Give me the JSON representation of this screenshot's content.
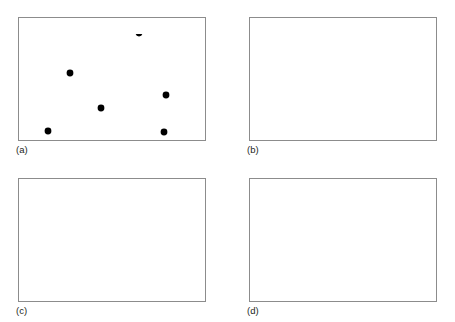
{
  "figure": {
    "width": 455,
    "height": 322,
    "background": "#ffffff"
  },
  "style": {
    "frame_color": "#8c8c8c",
    "frame_width": 1,
    "point_color": "#000000",
    "point_radius": 3.4,
    "solid_line_color": "#58585b",
    "solid_line_width": 1,
    "dotted_line_color": "#000000",
    "dotted_line_width": 3.4,
    "dotted_dash": "0.2 5.4",
    "label_color": "#231f20",
    "label_font_size": 9.5
  },
  "panels": [
    {
      "id": "a",
      "label": "(a)",
      "label_x": 16,
      "label_y": 153,
      "frame": {
        "x": 18,
        "y": 17,
        "width": 187,
        "height": 123
      },
      "shows_points": true,
      "shows_triangulation": false,
      "shows_voronoi": false
    },
    {
      "id": "b",
      "label": "(b)",
      "label_x": 247,
      "label_y": 153,
      "frame": {
        "x": 249,
        "y": 17,
        "width": 187,
        "height": 123
      },
      "shows_points": true,
      "shows_triangulation": true,
      "shows_voronoi": false
    },
    {
      "id": "c",
      "label": "(c)",
      "label_x": 16,
      "label_y": 314,
      "frame": {
        "x": 18,
        "y": 178,
        "width": 187,
        "height": 123
      },
      "shows_points": true,
      "shows_triangulation": true,
      "shows_voronoi": true
    },
    {
      "id": "d",
      "label": "(d)",
      "label_x": 247,
      "label_y": 314,
      "frame": {
        "x": 249,
        "y": 178,
        "width": 187,
        "height": 123
      },
      "shows_points": true,
      "shows_triangulation": false,
      "shows_voronoi": true
    }
  ],
  "geometry": {
    "note": "Coordinates are local to each 187x123 panel frame, origin at frame top-left",
    "points": [
      {
        "name": "p0",
        "x": 121,
        "y": 16
      },
      {
        "name": "p1",
        "x": 179,
        "y": 9
      },
      {
        "name": "p2",
        "x": 52,
        "y": 56
      },
      {
        "name": "p3",
        "x": 83,
        "y": 91
      },
      {
        "name": "p4",
        "x": 148,
        "y": 78
      },
      {
        "name": "p5",
        "x": 30,
        "y": 114
      },
      {
        "name": "p6",
        "x": 146,
        "y": 115
      }
    ],
    "triangulation_edges": [
      {
        "from": "p2",
        "to": "p0"
      },
      {
        "from": "p0",
        "to": "p1"
      },
      {
        "from": "p1",
        "to": "p4"
      },
      {
        "from": "p1",
        "to": "p6"
      },
      {
        "from": "p0",
        "to": "p3"
      },
      {
        "from": "p0",
        "to": "p4"
      },
      {
        "from": "p2",
        "to": "p3"
      },
      {
        "from": "p2",
        "to": "p5"
      },
      {
        "from": "p5",
        "to": "p3"
      },
      {
        "from": "p3",
        "to": "p4"
      },
      {
        "from": "p3",
        "to": "p6"
      },
      {
        "from": "p4",
        "to": "p6"
      },
      {
        "from": "p5",
        "to": "p6"
      }
    ],
    "voronoi_vertices": [
      {
        "name": "v0",
        "x": 96,
        "y": 39
      },
      {
        "name": "v1",
        "x": 155,
        "y": 29
      },
      {
        "name": "v2",
        "x": 48,
        "y": 75
      },
      {
        "name": "v3",
        "x": 123,
        "y": 94
      }
    ],
    "voronoi_edges": [
      {
        "from": "v0",
        "to": "v1"
      },
      {
        "from": "v0",
        "to": "v2"
      },
      {
        "from": "v0",
        "to": [
          99,
          0
        ]
      },
      {
        "from": "v1",
        "to": "v3"
      },
      {
        "from": "v1",
        "to": [
          149,
          0
        ]
      },
      {
        "from": "v2",
        "to": [
          0,
          54
        ]
      },
      {
        "from": "v2",
        "to": [
          55,
          123
        ]
      },
      {
        "from": "v3",
        "to": [
          115,
          123
        ]
      },
      {
        "from": "v3",
        "to": [
          187,
          80
        ]
      }
    ]
  }
}
